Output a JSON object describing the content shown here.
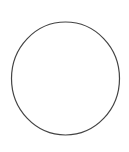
{
  "canvas": {
    "width": 129,
    "height": 152,
    "background": "#ffffff"
  },
  "shapes": [
    {
      "type": "ellipse",
      "name": "circle",
      "cx": 65.5,
      "cy": 78.5,
      "rx": 54,
      "ry": 56.5,
      "stroke": "#444444",
      "stroke_width": 1.2,
      "fill": "none"
    }
  ]
}
